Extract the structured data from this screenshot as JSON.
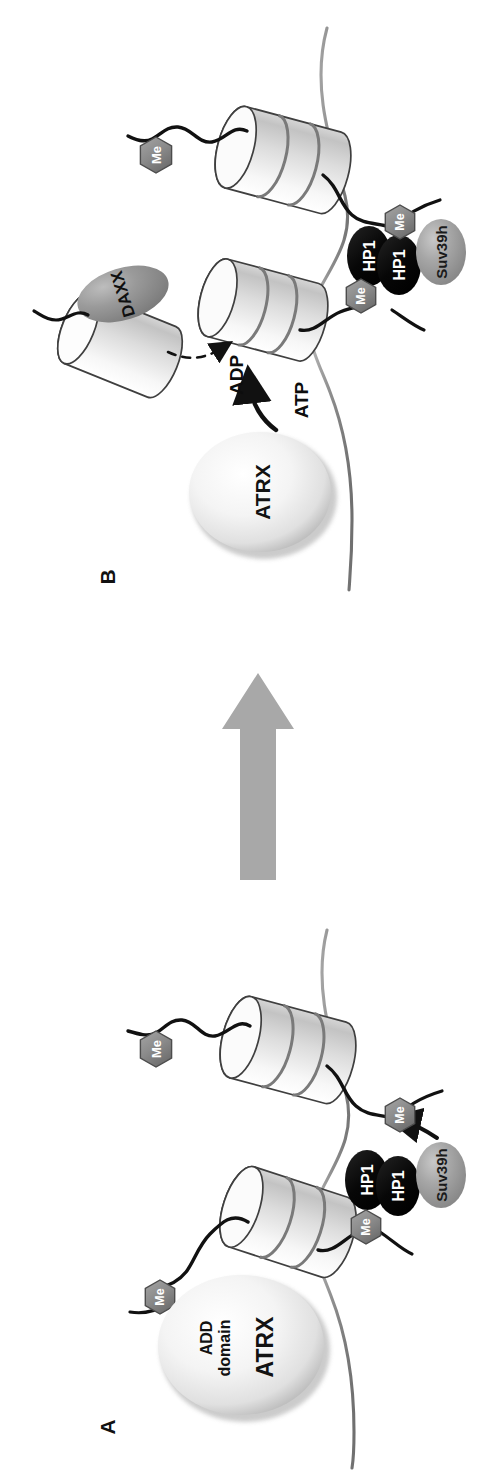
{
  "figure": {
    "orientation_deg": -90,
    "width": 498,
    "height": 1471,
    "background": "#ffffff"
  },
  "panels": [
    {
      "id": "B",
      "label": "B",
      "description": "ATRX hydrolyses ATP to ADP and deposits the DAXX-bound histone variant; the nucleosome is displaced.",
      "elements": {
        "atrx_label": "ATRX",
        "daxx_label": "DAXX",
        "hp1_left_label": "HP1",
        "hp1_right_label": "HP1",
        "suv39h_label": "Suv39h",
        "me_top_label": "Me",
        "me_upper_label": "Me",
        "me_lower_label": "Me",
        "atp_label": "ATP",
        "adp_label": "ADP"
      }
    },
    {
      "id": "A",
      "label": "A",
      "description": "ATRX ADD domain reads the methylated histone tail next to HP1 dimer recruited Suv39h.",
      "elements": {
        "atrx_label": "ATRX",
        "add_domain_line1": "ADD",
        "add_domain_line2": "domain",
        "hp1_left_label": "HP1",
        "hp1_right_label": "HP1",
        "suv39h_label": "Suv39h",
        "me_top_label": "Me",
        "me_upper_label": "Me",
        "me_lower_label": "Me"
      }
    }
  ],
  "transition_arrow": {
    "name": "transition-arrow",
    "direction": "A-to-B",
    "color": "#a8a8a8"
  },
  "colors": {
    "hp1_fill": "#0b0b0b",
    "hp1_text": "#ffffff",
    "suv39h_fill": "#9a9a9a",
    "daxx_fill": "#8e8e8e",
    "me_fill": "#8a8a8a",
    "me_text": "#ffffff",
    "atrx_fill": "#efefef",
    "nucleosome_fill": "#f2f2f2",
    "dna_stroke": "#8c8c8c",
    "tail_stroke": "#111111",
    "arrow_gray": "#a8a8a8",
    "outline": "#3a3a3a"
  }
}
